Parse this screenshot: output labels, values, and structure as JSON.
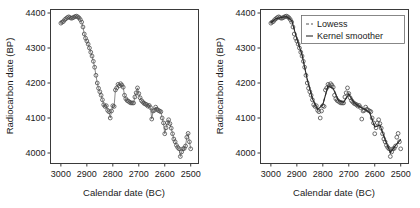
{
  "chart_data": [
    {
      "type": "scatter",
      "panel": "left",
      "title": "",
      "xlabel": "Calendar date (BC)",
      "ylabel": "Radiocarbon date (BP)",
      "xticks": [
        3000,
        2900,
        2800,
        2700,
        2600,
        2500
      ],
      "yticks": [
        4000,
        4100,
        4200,
        4300,
        4400
      ],
      "xlim": [
        3040,
        2470
      ],
      "ylim": [
        3970,
        4410
      ],
      "x_reversed": true,
      "grid": false,
      "legend": null,
      "marker": "open-circle",
      "connected": true,
      "x": [
        3000,
        2995,
        2990,
        2985,
        2980,
        2975,
        2970,
        2965,
        2960,
        2955,
        2950,
        2945,
        2940,
        2935,
        2930,
        2925,
        2920,
        2915,
        2910,
        2905,
        2900,
        2895,
        2890,
        2885,
        2880,
        2875,
        2870,
        2865,
        2860,
        2855,
        2850,
        2845,
        2840,
        2835,
        2830,
        2825,
        2820,
        2815,
        2810,
        2805,
        2800,
        2795,
        2790,
        2785,
        2780,
        2775,
        2770,
        2765,
        2760,
        2755,
        2750,
        2745,
        2740,
        2735,
        2730,
        2725,
        2720,
        2715,
        2710,
        2705,
        2700,
        2695,
        2690,
        2685,
        2680,
        2675,
        2670,
        2665,
        2660,
        2655,
        2650,
        2645,
        2640,
        2635,
        2630,
        2625,
        2620,
        2615,
        2610,
        2605,
        2600,
        2595,
        2590,
        2585,
        2580,
        2575,
        2570,
        2565,
        2560,
        2555,
        2550,
        2545,
        2540,
        2535,
        2530,
        2525,
        2520,
        2515,
        2510,
        2505,
        2500
      ],
      "y": [
        4371,
        4374,
        4376,
        4381,
        4384,
        4387,
        4389,
        4387,
        4385,
        4386,
        4388,
        4390,
        4391,
        4389,
        4386,
        4381,
        4374,
        4360,
        4340,
        4328,
        4320,
        4311,
        4300,
        4288,
        4277,
        4262,
        4245,
        4222,
        4200,
        4185,
        4175,
        4165,
        4152,
        4138,
        4133,
        4135,
        4122,
        4118,
        4100,
        4120,
        4135,
        4133,
        4180,
        4186,
        4196,
        4192,
        4198,
        4194,
        4188,
        4165,
        4155,
        4150,
        4148,
        4145,
        4143,
        4143,
        4143,
        4160,
        4172,
        4186,
        4170,
        4158,
        4150,
        4146,
        4142,
        4140,
        4138,
        4134,
        4136,
        4130,
        4097,
        4120,
        4122,
        4131,
        4125,
        4122,
        4120,
        4118,
        4100,
        4086,
        4055,
        4072,
        4086,
        4095,
        4084,
        4071,
        4055,
        4040,
        4032,
        4022,
        4016,
        4012,
        3990,
        4003,
        4012,
        4013,
        4020,
        4045,
        4056,
        4032,
        4012
      ]
    },
    {
      "type": "scatter",
      "panel": "right",
      "title": "",
      "xlabel": "Calendar date (BC)",
      "ylabel": "Radiocarbon date (BP)",
      "xticks": [
        3000,
        2900,
        2800,
        2700,
        2600,
        2500
      ],
      "yticks": [
        4000,
        4100,
        4200,
        4300,
        4400
      ],
      "xlim": [
        3040,
        2470
      ],
      "ylim": [
        3970,
        4410
      ],
      "x_reversed": true,
      "grid": false,
      "marker": "open-circle",
      "connected": false,
      "legend_position": "top-right",
      "legend": [
        "Lowess",
        "Kernel smoother"
      ],
      "x": [
        3000,
        2995,
        2990,
        2985,
        2980,
        2975,
        2970,
        2965,
        2960,
        2955,
        2950,
        2945,
        2940,
        2935,
        2930,
        2925,
        2920,
        2915,
        2910,
        2905,
        2900,
        2895,
        2890,
        2885,
        2880,
        2875,
        2870,
        2865,
        2860,
        2855,
        2850,
        2845,
        2840,
        2835,
        2830,
        2825,
        2820,
        2815,
        2810,
        2805,
        2800,
        2795,
        2790,
        2785,
        2780,
        2775,
        2770,
        2765,
        2760,
        2755,
        2750,
        2745,
        2740,
        2735,
        2730,
        2725,
        2720,
        2715,
        2710,
        2705,
        2700,
        2695,
        2690,
        2685,
        2680,
        2675,
        2670,
        2665,
        2660,
        2655,
        2650,
        2645,
        2640,
        2635,
        2630,
        2625,
        2620,
        2615,
        2610,
        2605,
        2600,
        2595,
        2590,
        2585,
        2580,
        2575,
        2570,
        2565,
        2560,
        2555,
        2550,
        2545,
        2540,
        2535,
        2530,
        2525,
        2520,
        2515,
        2510,
        2505,
        2500
      ],
      "y": [
        4371,
        4374,
        4376,
        4381,
        4384,
        4387,
        4389,
        4387,
        4385,
        4386,
        4388,
        4390,
        4391,
        4389,
        4386,
        4381,
        4374,
        4360,
        4340,
        4328,
        4320,
        4311,
        4300,
        4288,
        4277,
        4262,
        4245,
        4222,
        4200,
        4185,
        4175,
        4165,
        4152,
        4138,
        4133,
        4135,
        4122,
        4118,
        4100,
        4120,
        4135,
        4133,
        4180,
        4186,
        4196,
        4192,
        4198,
        4194,
        4188,
        4165,
        4155,
        4150,
        4148,
        4145,
        4143,
        4143,
        4143,
        4160,
        4172,
        4186,
        4170,
        4158,
        4150,
        4146,
        4142,
        4140,
        4138,
        4134,
        4136,
        4130,
        4097,
        4120,
        4122,
        4131,
        4125,
        4122,
        4120,
        4118,
        4100,
        4086,
        4055,
        4072,
        4086,
        4095,
        4084,
        4071,
        4055,
        4040,
        4032,
        4022,
        4016,
        4012,
        3990,
        4003,
        4012,
        4013,
        4020,
        4045,
        4056,
        4032,
        4012
      ],
      "series": [
        {
          "name": "Lowess",
          "style": "dashed",
          "color": "#555555",
          "x": [
            3000,
            2980,
            2960,
            2940,
            2920,
            2900,
            2880,
            2860,
            2840,
            2820,
            2800,
            2780,
            2760,
            2740,
            2720,
            2700,
            2680,
            2660,
            2640,
            2620,
            2600,
            2580,
            2560,
            2540,
            2520,
            2500
          ],
          "values": [
            4373,
            4383,
            4388,
            4390,
            4380,
            4330,
            4282,
            4212,
            4158,
            4126,
            4140,
            4190,
            4186,
            4152,
            4146,
            4170,
            4146,
            4134,
            4126,
            4118,
            4076,
            4078,
            4040,
            4000,
            4020,
            4040
          ]
        },
        {
          "name": "Kernel smoother",
          "style": "solid",
          "color": "#2a2a2a",
          "x": [
            3000,
            2980,
            2960,
            2940,
            2920,
            2900,
            2880,
            2860,
            2840,
            2820,
            2800,
            2780,
            2760,
            2740,
            2720,
            2700,
            2680,
            2660,
            2640,
            2620,
            2600,
            2580,
            2560,
            2540,
            2520,
            2500
          ],
          "values": [
            4372,
            4384,
            4387,
            4390,
            4379,
            4326,
            4280,
            4210,
            4155,
            4124,
            4138,
            4192,
            4184,
            4150,
            4145,
            4168,
            4144,
            4133,
            4125,
            4116,
            4074,
            4080,
            4038,
            4002,
            4022,
            4038
          ]
        }
      ]
    }
  ],
  "panel_left": {
    "xlabel": "Calendar date (BC)",
    "ylabel": "Radiocarbon date (BP)",
    "xticks": [
      "3000",
      "2900",
      "2800",
      "2700",
      "2600",
      "2500"
    ],
    "yticks": [
      "4400",
      "4300",
      "4200",
      "4100",
      "4000"
    ]
  },
  "panel_right": {
    "xlabel": "Calendar date (BC)",
    "ylabel": "Radiocarbon date (BP)",
    "xticks": [
      "3000",
      "2900",
      "2800",
      "2700",
      "2600",
      "2500"
    ],
    "yticks": [
      "4400",
      "4300",
      "4200",
      "4100",
      "4000"
    ],
    "legend": {
      "lowess_label": "Lowess",
      "kernel_label": "Kernel smoother"
    }
  },
  "colors": {
    "axis": "#3a3a3a",
    "point": "#4a4a4a",
    "connector": "#5a5a5a",
    "kernel": "#2a2a2a",
    "lowess": "#555555",
    "background": "#ffffff"
  }
}
